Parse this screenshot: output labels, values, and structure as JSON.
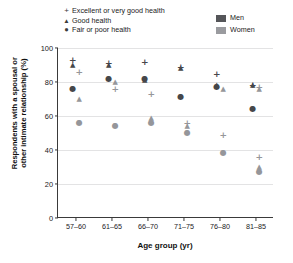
{
  "chart_data": {
    "type": "scatter",
    "title": "",
    "xlabel": "Age group (yr)",
    "ylabel": "Respondents with a spousal or other intimate relationship (%)",
    "categories": [
      "57–60",
      "61–65",
      "66–70",
      "71–75",
      "76–80",
      "81–85"
    ],
    "ylim": [
      0,
      100
    ],
    "yticks": [
      0,
      20,
      40,
      60,
      80,
      100
    ],
    "grid": true,
    "legend_position": "top",
    "series": [
      {
        "name": "Excellent or very good health, Men",
        "marker": "plus",
        "sex": "Men",
        "health": "Excellent or very good health",
        "values": [
          93,
          91,
          92,
          89,
          85,
          78
        ]
      },
      {
        "name": "Good health, Men",
        "marker": "triangle",
        "sex": "Men",
        "health": "Good health",
        "values": [
          90,
          82,
          82,
          88,
          78,
          78
        ]
      },
      {
        "name": "Fair or poor health, Men",
        "marker": "circle",
        "sex": "Men",
        "health": "Fair or poor health",
        "values": [
          76,
          82,
          81,
          71,
          77,
          64
        ]
      },
      {
        "name": "Excellent or very good health, Women",
        "marker": "plus",
        "sex": "Women",
        "health": "Excellent or very good health",
        "values": [
          86,
          76,
          73,
          56,
          49,
          36
        ]
      },
      {
        "name": "Good health, Women",
        "marker": "triangle",
        "sex": "Women",
        "health": "Good health",
        "values": [
          70,
          80,
          59,
          54,
          76,
          30
        ]
      },
      {
        "name": "Fair or poor health, Women",
        "marker": "circle",
        "sex": "Women",
        "health": "Fair or poor health",
        "values": [
          56,
          54,
          56,
          50,
          38,
          27
        ]
      }
    ],
    "points": [
      {
        "group": 0,
        "sex": "Men",
        "marker": "plus",
        "value": 93
      },
      {
        "group": 0,
        "sex": "Men",
        "marker": "tri",
        "value": 90
      },
      {
        "group": 0,
        "sex": "Women",
        "marker": "plus",
        "value": 86
      },
      {
        "group": 0,
        "sex": "Men",
        "marker": "dot",
        "value": 76
      },
      {
        "group": 0,
        "sex": "Women",
        "marker": "tri",
        "value": 70
      },
      {
        "group": 0,
        "sex": "Women",
        "marker": "dot",
        "value": 56
      },
      {
        "group": 1,
        "sex": "Men",
        "marker": "plus",
        "value": 91
      },
      {
        "group": 1,
        "sex": "Men",
        "marker": "tri",
        "value": 90
      },
      {
        "group": 1,
        "sex": "Men",
        "marker": "dot",
        "value": 82
      },
      {
        "group": 1,
        "sex": "Women",
        "marker": "tri",
        "value": 80
      },
      {
        "group": 1,
        "sex": "Women",
        "marker": "plus",
        "value": 76
      },
      {
        "group": 1,
        "sex": "Women",
        "marker": "dot",
        "value": 54
      },
      {
        "group": 2,
        "sex": "Men",
        "marker": "plus",
        "value": 92
      },
      {
        "group": 2,
        "sex": "Men",
        "marker": "dot",
        "value": 82
      },
      {
        "group": 2,
        "sex": "Men",
        "marker": "tri",
        "value": 81
      },
      {
        "group": 2,
        "sex": "Women",
        "marker": "plus",
        "value": 73
      },
      {
        "group": 2,
        "sex": "Women",
        "marker": "tri",
        "value": 59
      },
      {
        "group": 2,
        "sex": "Women",
        "marker": "dot",
        "value": 56
      },
      {
        "group": 3,
        "sex": "Men",
        "marker": "plus",
        "value": 89
      },
      {
        "group": 3,
        "sex": "Men",
        "marker": "tri",
        "value": 88
      },
      {
        "group": 3,
        "sex": "Men",
        "marker": "dot",
        "value": 71
      },
      {
        "group": 3,
        "sex": "Women",
        "marker": "plus",
        "value": 56
      },
      {
        "group": 3,
        "sex": "Women",
        "marker": "tri",
        "value": 54
      },
      {
        "group": 3,
        "sex": "Women",
        "marker": "dot",
        "value": 50
      },
      {
        "group": 4,
        "sex": "Men",
        "marker": "plus",
        "value": 85
      },
      {
        "group": 4,
        "sex": "Men",
        "marker": "tri",
        "value": 78
      },
      {
        "group": 4,
        "sex": "Men",
        "marker": "dot",
        "value": 77
      },
      {
        "group": 4,
        "sex": "Women",
        "marker": "tri",
        "value": 76
      },
      {
        "group": 4,
        "sex": "Women",
        "marker": "plus",
        "value": 49
      },
      {
        "group": 4,
        "sex": "Women",
        "marker": "dot",
        "value": 38
      },
      {
        "group": 5,
        "sex": "Men",
        "marker": "plus",
        "value": 78
      },
      {
        "group": 5,
        "sex": "Men",
        "marker": "tri",
        "value": 78
      },
      {
        "group": 5,
        "sex": "Women",
        "marker": "plus",
        "value": 77
      },
      {
        "group": 5,
        "sex": "Women",
        "marker": "tri",
        "value": 76
      },
      {
        "group": 5,
        "sex": "Men",
        "marker": "dot",
        "value": 64
      },
      {
        "group": 5,
        "sex": "Women",
        "marker": "plus",
        "value": 36
      },
      {
        "group": 5,
        "sex": "Women",
        "marker": "tri",
        "value": 30
      },
      {
        "group": 5,
        "sex": "Women",
        "marker": "dot",
        "value": 27
      }
    ]
  },
  "legend_health": {
    "items": [
      {
        "symbol": "+",
        "label": "Excellent or very good health",
        "shape": "plus"
      },
      {
        "symbol": "▲",
        "label": "Good health",
        "shape": "tri"
      },
      {
        "symbol": "●",
        "label": "Fair or poor health",
        "shape": "dot"
      }
    ]
  },
  "legend_sex": {
    "items": [
      {
        "label": "Men",
        "color": "#555659"
      },
      {
        "label": "Women",
        "color": "#9a9b9f"
      }
    ]
  },
  "axes": {
    "x_title": "Age group (yr)",
    "y_title_line1": "Respondents with a spousal or",
    "y_title_line2": "other intimate relationship (%)"
  }
}
